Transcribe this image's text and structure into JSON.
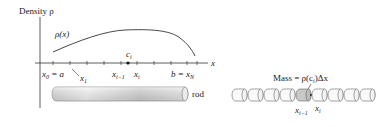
{
  "left_diagram": {
    "y_axis_label": "Density ρ",
    "curve_label": "ρ(x)",
    "x_axis_label": "x",
    "point_label": "c",
    "point_sub": "i",
    "tick_labels": {
      "x0_eq_a": "x",
      "x0_sub": "0",
      "x0_rest": " = a",
      "x1": "x",
      "x1_sub": "1",
      "xi_minus_1": "x",
      "xi_minus_1_sub": "i−1",
      "xi": "x",
      "xi_sub": "i",
      "b_eq_xN": "b = x",
      "b_sub": "N"
    },
    "rod_label": "rod"
  },
  "right_diagram": {
    "mass_label_prefix": "Mass = ρ(c",
    "mass_label_sub": "i",
    "mass_label_suffix": ")Δx",
    "seg_left": "x",
    "seg_left_sub": "i−1",
    "seg_right": "x",
    "seg_right_sub": "i",
    "segment_count": 9,
    "highlighted_segment": 5
  },
  "colors": {
    "ink": "#222222",
    "rod_light": "#f2f2f2",
    "rod_dark": "#bdbdbd",
    "highlight": "#c8c8c8"
  }
}
